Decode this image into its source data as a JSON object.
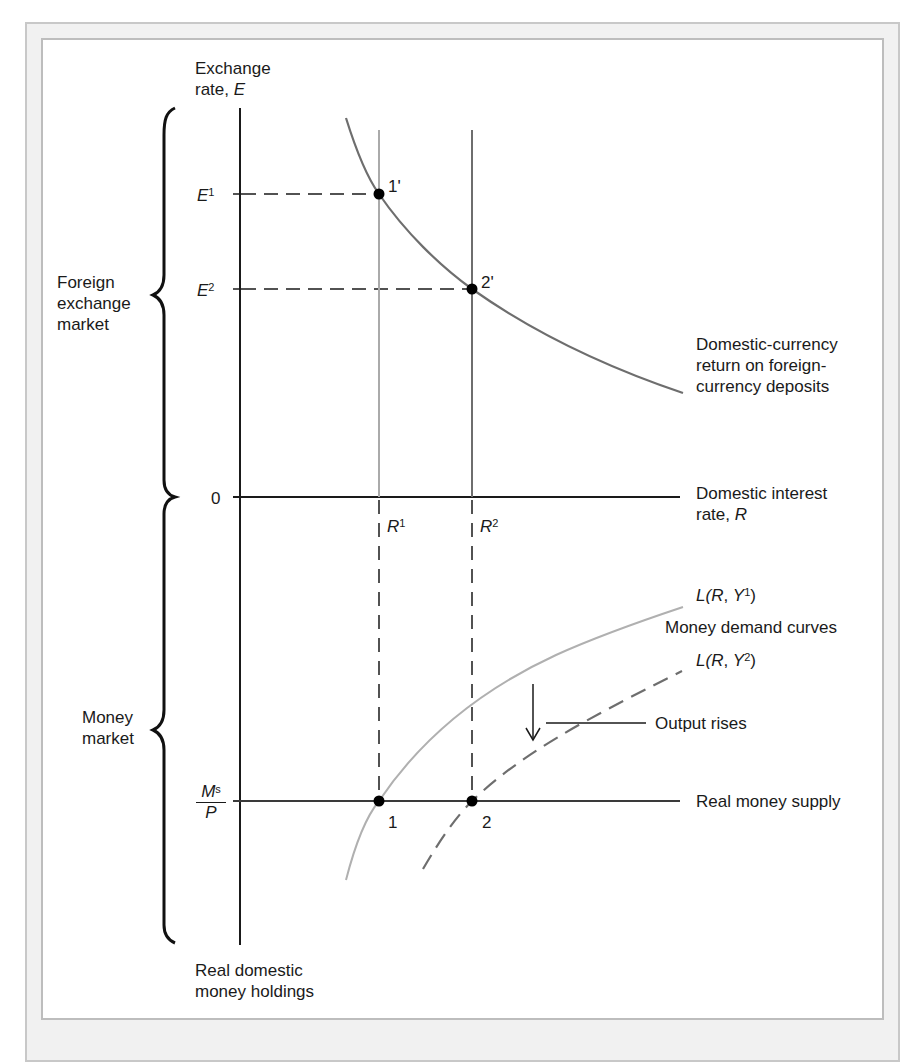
{
  "diagram": {
    "type": "economics-two-panel",
    "top_panel": {
      "bracket_label": "Foreign exchange market",
      "y_axis_label": "Exchange rate, E",
      "x_axis_label": "Domestic interest rate, R",
      "origin_label": "0",
      "ticks_y": [
        "E1",
        "E2"
      ],
      "ticks_x": [
        "R1",
        "R2"
      ],
      "curve_label": "Domestic-currency return on foreign-currency deposits",
      "points": [
        "1'",
        "2'"
      ]
    },
    "bottom_panel": {
      "bracket_label": "Money market",
      "y_axis_label": "Real domestic money holdings",
      "money_supply_label": "Real money supply",
      "ms_tick": "Ms/P",
      "curves": [
        "L(R, Y1)",
        "L(R, Y2)"
      ],
      "curves_group_label": "Money demand curves",
      "annotation": "Output rises",
      "points": [
        "1",
        "2"
      ]
    },
    "colors": {
      "axis": "#1a1a1a",
      "curve_dark": "#6e6e6e",
      "curve_light": "#b0b0b0",
      "frame_fill": "#f1f1f1",
      "frame_border": "#c8c8c8"
    }
  },
  "labels": {
    "y_axis_top_line1": "Exchange",
    "y_axis_top_line2": "rate, ",
    "y_axis_top_var": "E",
    "fx_market_line1": "Foreign",
    "fx_market_line2": "exchange",
    "fx_market_line3": "market",
    "money_market_line1": "Money",
    "money_market_line2": "market",
    "e1_var": "E",
    "e1_sup": "1",
    "e2_var": "E",
    "e2_sup": "2",
    "zero": "0",
    "r1_var": "R",
    "r1_sup": "1",
    "r2_var": "R",
    "r2_sup": "2",
    "point_1p": "1'",
    "point_2p": "2'",
    "point_1": "1",
    "point_2": "2",
    "return_curve_line1": "Domestic-currency",
    "return_curve_line2": "return on foreign-",
    "return_curve_line3": "currency deposits",
    "interest_line1": "Domestic interest",
    "interest_line2": "rate, ",
    "interest_var": "R",
    "ly1_prefix": "L(",
    "ly1_r": "R",
    "ly1_mid": ", ",
    "ly1_y": "Y",
    "ly1_sup": "1",
    "ly1_suffix": ")",
    "ly2_prefix": "L(",
    "ly2_r": "R",
    "ly2_mid": ", ",
    "ly2_y": "Y",
    "ly2_sup": "2",
    "ly2_suffix": ")",
    "money_demand": "Money demand curves",
    "output_rises": "Output rises",
    "ms_num": "M",
    "ms_sup": "s",
    "ms_den": "P",
    "real_money_supply": "Real money supply",
    "holdings_line1": "Real domestic",
    "holdings_line2": "money holdings"
  }
}
